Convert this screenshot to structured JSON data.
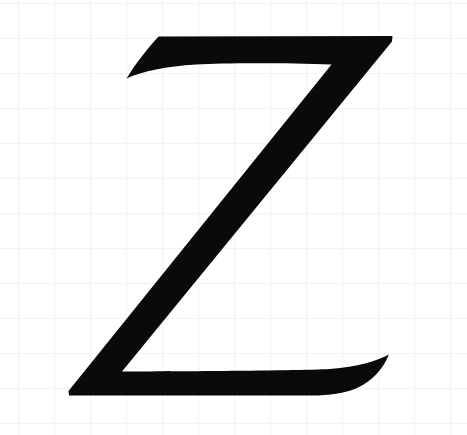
{
  "canvas": {
    "width": 467,
    "height": 435,
    "background_color": "#ffffff",
    "description": "Scanned calligraphic capital letter Z on faint graph paper"
  },
  "grid": {
    "visible": true,
    "line_color": "#f1f2f4",
    "line_width": 1,
    "cell_size_x": 36,
    "cell_size_y": 35,
    "origin_x": 18,
    "origin_y": 3,
    "vertical_line_positions": [
      18,
      54,
      90,
      126,
      162,
      198,
      234,
      270,
      306,
      342,
      378,
      414,
      450
    ],
    "horizontal_line_positions": [
      3,
      38,
      73,
      108,
      143,
      178,
      213,
      248,
      283,
      318,
      353,
      388,
      423
    ]
  },
  "glyph": {
    "character": "Z",
    "name": "latin-capital-letter-z",
    "style": "calligraphic-serif-italic",
    "fill_color": "#0a0a0a",
    "bounding_box": {
      "left": 68,
      "top": 35,
      "right": 393,
      "bottom": 396,
      "width": 325,
      "height": 361
    },
    "anchor_points": {
      "top_left_tip": [
        126,
        78
      ],
      "top_bar_left_top": [
        158,
        36
      ],
      "top_bar_right_corner": [
        392,
        36
      ],
      "top_inner_notch": [
        331,
        64
      ],
      "diagonal_top_right": [
        392,
        40
      ],
      "diagonal_bottom_left": [
        118,
        372
      ],
      "bottom_left_tip": [
        69,
        394
      ],
      "bottom_bar_right_tail_tip": [
        389,
        355
      ],
      "bottom_bar_baseline": [
        150,
        392
      ]
    },
    "stroke_weights": {
      "top_bar_thickness": 27,
      "diagonal_thickness": 62,
      "bottom_bar_thickness": 30
    },
    "path": "M 126.5 78.5 C 134 66 146 50 158.5 36.5 L 392.5 36.0 L 392.0 41.5 L 122.0 371.5 C 122.0 371.5 300.0 371.0 330.0 369.0 C 358.0 367.0 376.0 361.0 389.0 354.5 C 383.0 369.0 372.0 381.5 357.0 388.0 C 344.0 393.5 330.0 395.5 312.0 395.5 L 69.0 395.5 L 68.5 391.0 L 331.5 64.5 C 290.0 63.0 228.0 62.5 196.0 64.5 C 166.0 66.5 143.0 71.0 126.5 78.5 Z"
  },
  "labels": {
    "alt_text": "Black calligraphic capital letter Z",
    "title": "Z"
  }
}
